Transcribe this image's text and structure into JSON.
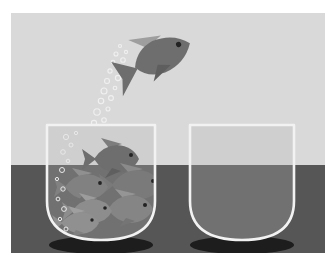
{
  "illustration": {
    "title": "Fish jumping from a crowded fishbowl to an empty fishbowl",
    "style": "grayscale flat vector illustration",
    "frame": {
      "x": 11,
      "y": 13,
      "width": 314,
      "height": 240
    },
    "palette": {
      "page_background": "#ffffff",
      "sky_gray": "#d9d9d9",
      "ground_gray": "#565656",
      "bowl_outline": "#f2f2f2",
      "bowl_water_upper": "#cfcfcf",
      "bowl_water_lower": "#6e6e6e",
      "fish_body_dark": "#6e6e6e",
      "fish_body_light": "#9a9a9a",
      "fish_fin_light": "#b4b4b4",
      "fish_eye": "#2b2b2b",
      "bubble_stroke": "#f0f0f0",
      "shadow_dark": "#1d1d1d"
    },
    "horizon": {
      "y": 152,
      "label": "horizon line"
    },
    "background": {
      "upper_band": "light gray sky",
      "lower_band": "dark gray floor"
    },
    "bowls": [
      {
        "name": "crowded-fishbowl",
        "side": "left",
        "x": 36,
        "y": 109,
        "width": 108,
        "height": 118,
        "state": "overcrowded",
        "fish_count": 6,
        "shadow": {
          "cx": 90,
          "cy": 232,
          "rx": 52,
          "ry": 9
        }
      },
      {
        "name": "empty-fishbowl",
        "side": "right",
        "x": 179,
        "y": 109,
        "width": 104,
        "height": 118,
        "state": "empty",
        "fish_count": 0,
        "shadow": {
          "cx": 231,
          "cy": 232,
          "rx": 52,
          "ry": 9
        }
      }
    ],
    "jumping_fish": {
      "name": "jumping-fish",
      "x": 118,
      "y": 16,
      "width": 66,
      "height": 56,
      "direction": "up-right",
      "description": "single fish leaping out of the crowded bowl toward the empty bowl"
    },
    "bubble_trail": {
      "name": "bubble-trail",
      "count": 34,
      "description": "rising column of white bubbles from the crowded bowl to the jumping fish",
      "from": {
        "x": 62,
        "y": 200
      },
      "to": {
        "x": 122,
        "y": 40
      }
    },
    "school_fish": [
      {
        "id": 1,
        "cx": 102,
        "cy": 146,
        "size": 42,
        "flip": false,
        "tone": "dark"
      },
      {
        "id": 2,
        "cx": 122,
        "cy": 170,
        "size": 46,
        "flip": false,
        "tone": "dark"
      },
      {
        "id": 3,
        "cx": 76,
        "cy": 172,
        "size": 40,
        "flip": false,
        "tone": "dark"
      },
      {
        "id": 4,
        "cx": 116,
        "cy": 192,
        "size": 42,
        "flip": false,
        "tone": "dark"
      },
      {
        "id": 5,
        "cx": 82,
        "cy": 196,
        "size": 38,
        "flip": false,
        "tone": "light"
      },
      {
        "id": 6,
        "cx": 70,
        "cy": 208,
        "size": 36,
        "flip": false,
        "tone": "light"
      }
    ]
  }
}
